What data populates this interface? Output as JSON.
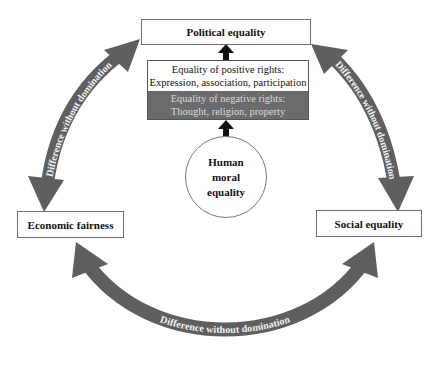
{
  "diagram": {
    "nodes": {
      "political": {
        "label": "Political equality"
      },
      "economic": {
        "label": "Economic fairness"
      },
      "social": {
        "label": "Social equality"
      },
      "core": {
        "lines": [
          "Human",
          "moral",
          "equality"
        ]
      }
    },
    "rights_box": {
      "positive": {
        "title": "Equality of positive rights:",
        "items": "Expression, association, participation"
      },
      "negative": {
        "title": "Equality of negative rights:",
        "items": "Thought, religion, property"
      }
    },
    "arrows": {
      "left": {
        "label": "Difference without domination",
        "from": "Economic fairness",
        "to": "Political equality",
        "bidirectional": true
      },
      "right": {
        "label": "Difference without domination",
        "from": "Political equality",
        "to": "Social equality",
        "bidirectional": true
      },
      "bottom": {
        "label": "Difference without domination",
        "from": "Economic fairness",
        "to": "Social equality",
        "bidirectional": true
      },
      "vertical": [
        {
          "from": "Human moral equality",
          "to": "Equality of negative rights"
        },
        {
          "from": "Equality of positive rights",
          "to": "Political equality"
        }
      ]
    },
    "colors": {
      "arrow_fill": "#5f5f5f",
      "negative_rights_bg": "#6b6b6b",
      "negative_rights_text": "#d9d9d9",
      "box_border": "#6e6e6e",
      "small_arrow": "#111111"
    }
  }
}
